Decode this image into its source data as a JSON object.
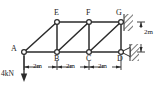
{
  "figure": {
    "type": "truss-free-body-diagram",
    "colors": {
      "member": "#2b2b2b",
      "node_fill": "#ffffff",
      "dimension": "#2b2b2b",
      "hatch": "#555555",
      "text": "#1a1a1a"
    }
  },
  "nodes": [
    {
      "id": "A",
      "label": "A",
      "x": 24,
      "y": 52,
      "label_x": 11,
      "label_y": 47
    },
    {
      "id": "B",
      "label": "B",
      "x": 57,
      "y": 52,
      "label_x": 55,
      "label_y": 56
    },
    {
      "id": "C",
      "label": "C",
      "x": 89,
      "y": 52,
      "label_x": 86,
      "label_y": 56
    },
    {
      "id": "D",
      "label": "D",
      "x": 121,
      "y": 52,
      "label_x": 118,
      "label_y": 56
    },
    {
      "id": "E",
      "label": "E",
      "x": 57,
      "y": 22,
      "label_x": 54,
      "label_y": 8
    },
    {
      "id": "F",
      "label": "F",
      "x": 89,
      "y": 22,
      "label_x": 86,
      "label_y": 8
    },
    {
      "id": "G",
      "label": "G",
      "x": 121,
      "y": 22,
      "label_x": 117,
      "label_y": 8
    }
  ],
  "members": [
    {
      "from": "A",
      "to": "B",
      "kind": "bottom-chord"
    },
    {
      "from": "B",
      "to": "C",
      "kind": "bottom-chord"
    },
    {
      "from": "C",
      "to": "D",
      "kind": "bottom-chord"
    },
    {
      "from": "E",
      "to": "F",
      "kind": "top-chord"
    },
    {
      "from": "F",
      "to": "G",
      "kind": "top-chord"
    },
    {
      "from": "B",
      "to": "E",
      "kind": "vertical"
    },
    {
      "from": "C",
      "to": "F",
      "kind": "vertical"
    },
    {
      "from": "D",
      "to": "G",
      "kind": "vertical"
    },
    {
      "from": "A",
      "to": "E",
      "kind": "diagonal"
    },
    {
      "from": "B",
      "to": "F",
      "kind": "diagonal"
    },
    {
      "from": "C",
      "to": "G",
      "kind": "diagonal"
    }
  ],
  "supports": [
    {
      "at": "G",
      "type": "pin-wall",
      "note": "hatched wall, right side"
    },
    {
      "at": "D",
      "type": "pin-wall",
      "note": "triangle into hatched wall, right side"
    }
  ],
  "load": {
    "label": "4kN",
    "at": "A",
    "direction": "down",
    "label_x": 2,
    "label_y": 71
  },
  "dimensions": {
    "horizontal": [
      {
        "label": "2m",
        "from": "A",
        "to": "B",
        "center_x": 40,
        "y": 62
      },
      {
        "label": "2m",
        "from": "B",
        "to": "C",
        "center_x": 73,
        "y": 62
      },
      {
        "label": "2m",
        "from": "C",
        "to": "D",
        "center_x": 105,
        "y": 62
      }
    ],
    "vertical": [
      {
        "label": "2m",
        "from": "G",
        "to": "D",
        "x": 139,
        "center_y": 33
      }
    ]
  }
}
